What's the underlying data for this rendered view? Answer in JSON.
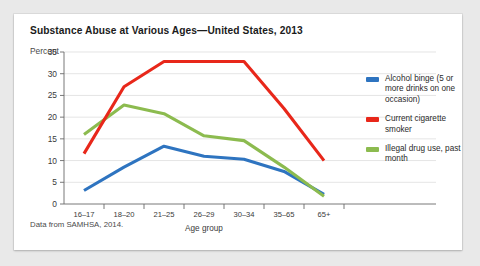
{
  "card": {
    "title": "Substance Abuse at Various Ages—United States, 2013",
    "percent_label": "Percent",
    "source": "Data from SAMHSA, 2014."
  },
  "legend": {
    "position": "right",
    "items": [
      {
        "label": "Alcohol binge (5 or more drinks on one occasion)",
        "color": "#2E74C0"
      },
      {
        "label": "Current cigarette smoker",
        "color": "#E8271A"
      },
      {
        "label": "Illegal drug use, past month",
        "color": "#8CBB4F"
      }
    ]
  },
  "chart_data": {
    "type": "line",
    "title": "Substance Abuse at Various Ages—United States, 2013",
    "xlabel": "Age group",
    "ylabel": "Percent",
    "categories": [
      "16–17",
      "18–20",
      "21–25",
      "26–29",
      "30–34",
      "35–65",
      "65+"
    ],
    "yticks": [
      0,
      5,
      10,
      15,
      20,
      25,
      30,
      35
    ],
    "ylim": [
      0,
      35
    ],
    "grid": true,
    "series": [
      {
        "name": "Alcohol binge (5 or more drinks on one occasion)",
        "color": "#2E74C0",
        "values": [
          3.1,
          8.5,
          13.3,
          11.0,
          10.3,
          7.5,
          2.2
        ]
      },
      {
        "name": "Current cigarette smoker",
        "color": "#E8271A",
        "values": [
          11.6,
          27.0,
          32.8,
          32.8,
          32.8,
          22.0,
          10.0
        ]
      },
      {
        "name": "Illegal drug use, past month",
        "color": "#8CBB4F",
        "values": [
          16.0,
          22.8,
          20.8,
          15.7,
          14.6,
          8.5,
          1.8
        ]
      }
    ],
    "annotation": "Data from SAMHSA, 2014."
  }
}
